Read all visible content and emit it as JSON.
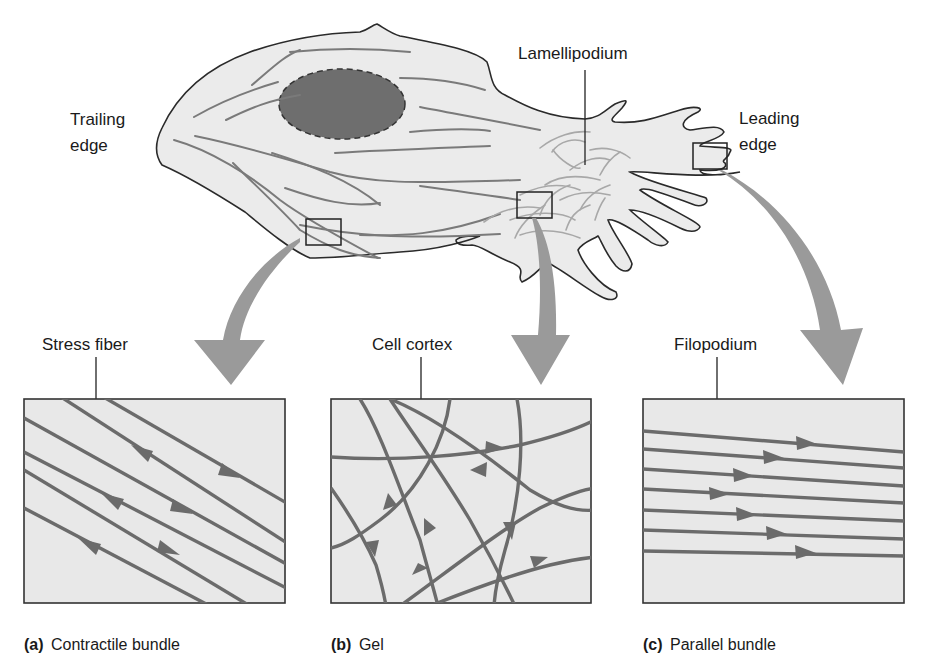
{
  "figure": {
    "cell_labels": {
      "trailing_edge_line1": "Trailing",
      "trailing_edge_line2": "edge",
      "lamellipodium": "Lamellipodium",
      "leading_edge_line1": "Leading",
      "leading_edge_line2": "edge"
    },
    "panels": [
      {
        "id": "a",
        "callout": "Stress fiber",
        "caption_letter": "(a)",
        "caption_text": "Contractile bundle"
      },
      {
        "id": "b",
        "callout": "Cell cortex",
        "caption_letter": "(b)",
        "caption_text": "Gel"
      },
      {
        "id": "c",
        "callout": "Filopodium",
        "caption_letter": "(c)",
        "caption_text": "Parallel bundle"
      }
    ],
    "colors": {
      "cytoplasm": "#ebebeb",
      "nucleus": "#6e6e6e",
      "filament": "#6b6b6b",
      "arrow": "#9a9a9a",
      "panel_fill": "#e8e8e8"
    }
  }
}
